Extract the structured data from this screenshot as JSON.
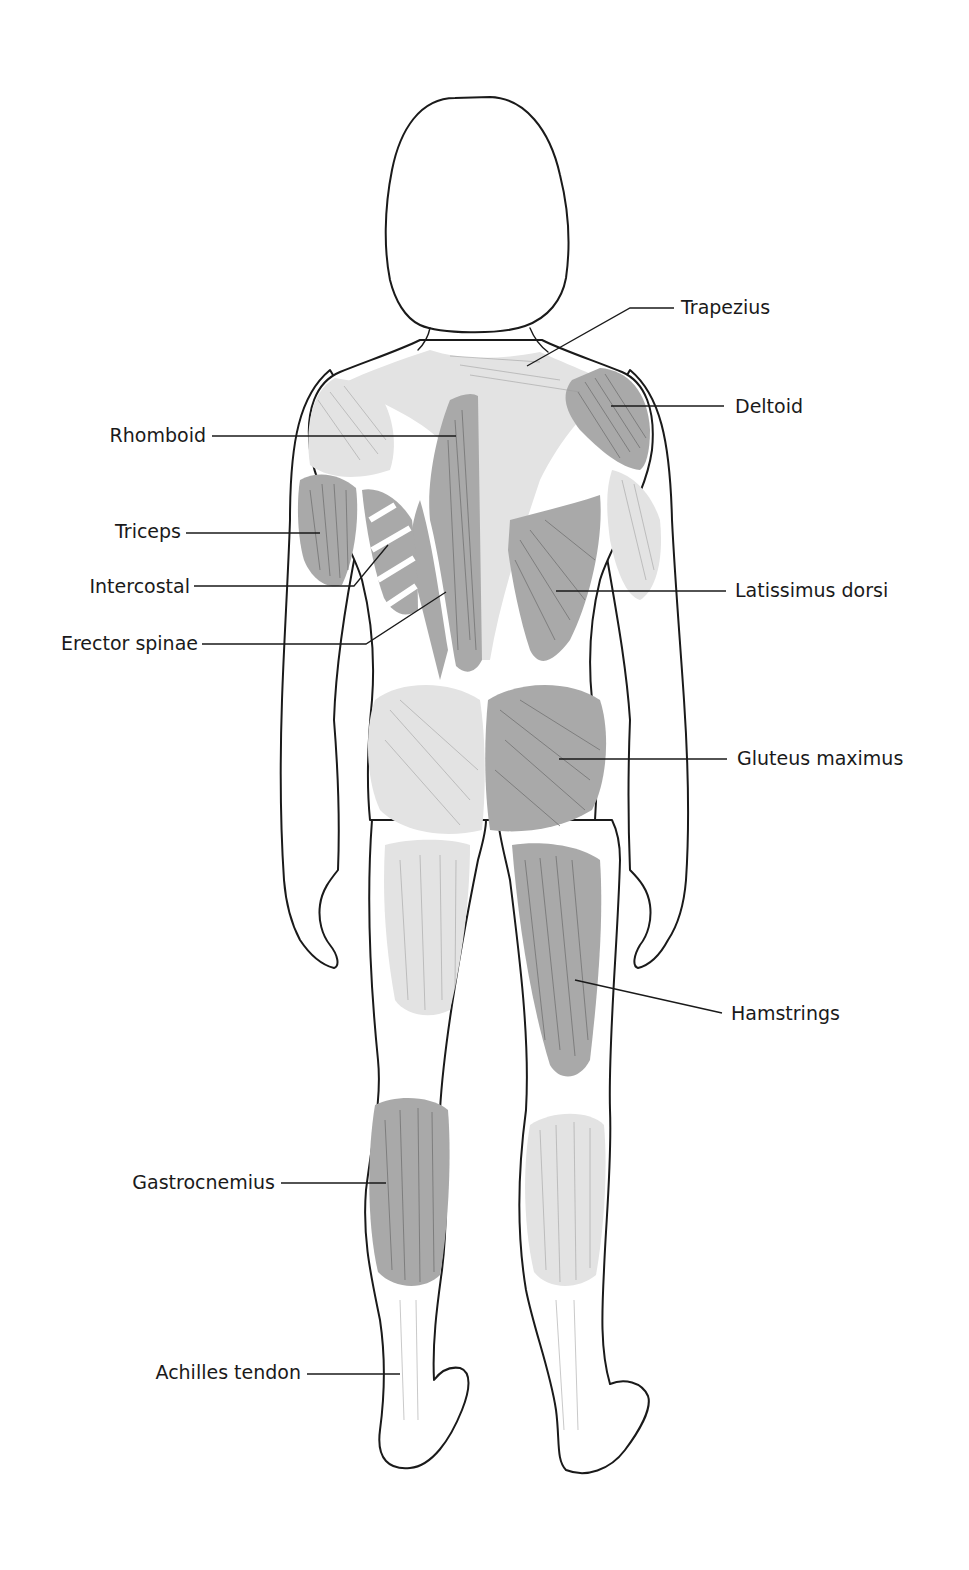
{
  "diagram": {
    "title": "",
    "view": "posterior",
    "colors": {
      "background": "#ffffff",
      "outline": "#1a1a1a",
      "labeled_muscle_fill": "#a9a9a9",
      "unlabeled_muscle_fill": "#e3e3e3",
      "text": "#1a1a1a"
    },
    "labels": {
      "left": [
        {
          "id": "rhomboid",
          "text": "Rhomboid"
        },
        {
          "id": "triceps",
          "text": "Triceps"
        },
        {
          "id": "intercostal",
          "text": "Intercostal"
        },
        {
          "id": "erector_spinae",
          "text": "Erector spinae"
        },
        {
          "id": "gastrocnemius",
          "text": "Gastrocnemius"
        },
        {
          "id": "achilles_tendon",
          "text": "Achilles tendon"
        }
      ],
      "right": [
        {
          "id": "trapezius",
          "text": "Trapezius"
        },
        {
          "id": "deltoid",
          "text": "Deltoid"
        },
        {
          "id": "latissimus_dorsi",
          "text": "Latissimus dorsi"
        },
        {
          "id": "gluteus_maximus",
          "text": "Gluteus maximus"
        },
        {
          "id": "hamstrings",
          "text": "Hamstrings"
        }
      ]
    }
  }
}
